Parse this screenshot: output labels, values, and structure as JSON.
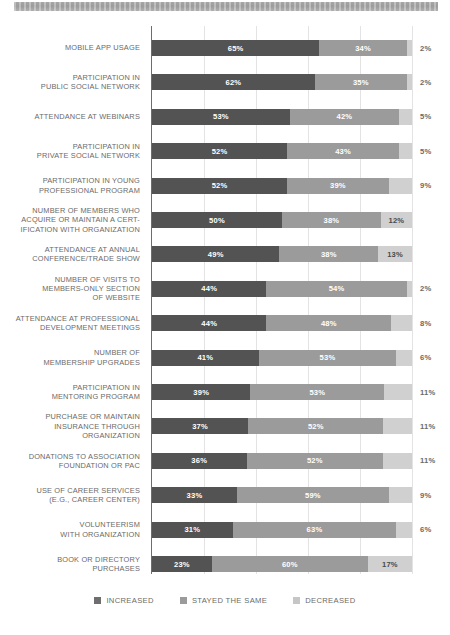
{
  "banner": {
    "name": "decorative-header-strip"
  },
  "chart_data": {
    "type": "bar",
    "subtype": "stacked-horizontal-100pct",
    "title": "",
    "xlabel": "",
    "ylabel": "",
    "xlim": [
      0,
      100
    ],
    "grid": true,
    "gridlines_pct": [
      0,
      20,
      40,
      60,
      80,
      100
    ],
    "legend_position": "bottom-center",
    "colors": {
      "increased": "#535353",
      "stayed_the_same": "#9b9b9b",
      "decreased": "#d0d0d0"
    },
    "categories": [
      "MOBILE APP USAGE",
      "PARTICIPATION IN\nPUBLIC SOCIAL NETWORK",
      "ATTENDANCE AT WEBINARS",
      "PARTICIPATION IN\nPRIVATE SOCIAL NETWORK",
      "PARTICIPATION IN YOUNG\nPROFESSIONAL PROGRAM",
      "NUMBER OF MEMBERS WHO\nACQUIRE OR MAINTAIN A CERT-\nIFICATION WITH ORGANIZATION",
      "ATTENDANCE AT ANNUAL\nCONFERENCE/TRADE SHOW",
      "NUMBER OF VISITS TO\nMEMBERS-ONLY SECTION\nOF WEBSITE",
      "ATTENDANCE AT PROFESSIONAL\nDEVELOPMENT MEETINGS",
      "NUMBER OF\nMEMBERSHIP UPGRADES",
      "PARTICIPATION IN\nMENTORING PROGRAM",
      "PURCHASE OR MAINTAIN\nINSURANCE THROUGH\nORGANIZATION",
      "DONATIONS TO ASSOCIATION\nFOUNDATION OR PAC",
      "USE OF CAREER SERVICES\n(E.G., CAREER CENTER)",
      "VOLUNTEERISM\nWITH ORGANIZATION",
      "BOOK OR DIRECTORY\nPURCHASES"
    ],
    "series": [
      {
        "name": "INCREASED",
        "color": "#535353",
        "values": [
          65,
          62,
          53,
          52,
          52,
          50,
          49,
          44,
          44,
          41,
          39,
          37,
          36,
          33,
          31,
          23
        ]
      },
      {
        "name": "STAYED THE SAME",
        "color": "#9b9b9b",
        "values": [
          34,
          35,
          42,
          43,
          39,
          38,
          38,
          54,
          48,
          53,
          53,
          52,
          52,
          59,
          63,
          60
        ]
      },
      {
        "name": "DECREASED",
        "color": "#d0d0d0",
        "values": [
          2,
          2,
          5,
          5,
          9,
          12,
          13,
          2,
          8,
          6,
          11,
          11,
          11,
          9,
          6,
          17
        ]
      }
    ],
    "value_labels": [
      {
        "increased": "65%",
        "stayed": "34%",
        "decreased": "2%",
        "decreased_outside": true
      },
      {
        "increased": "62%",
        "stayed": "35%",
        "decreased": "2%",
        "decreased_outside": true
      },
      {
        "increased": "53%",
        "stayed": "42%",
        "decreased": "5%",
        "decreased_outside": true
      },
      {
        "increased": "52%",
        "stayed": "43%",
        "decreased": "5%",
        "decreased_outside": true
      },
      {
        "increased": "52%",
        "stayed": "39%",
        "decreased": "9%",
        "decreased_outside": true
      },
      {
        "increased": "50%",
        "stayed": "38%",
        "decreased": "12%",
        "decreased_outside": false
      },
      {
        "increased": "49%",
        "stayed": "38%",
        "decreased": "13%",
        "decreased_outside": false
      },
      {
        "increased": "44%",
        "stayed": "54%",
        "decreased": "2%",
        "decreased_outside": true
      },
      {
        "increased": "44%",
        "stayed": "48%",
        "decreased": "8%",
        "decreased_outside": true
      },
      {
        "increased": "41%",
        "stayed": "53%",
        "decreased": "6%",
        "decreased_outside": true
      },
      {
        "increased": "39%",
        "stayed": "53%",
        "decreased": "11%",
        "decreased_outside": true
      },
      {
        "increased": "37%",
        "stayed": "52%",
        "decreased": "11%",
        "decreased_outside": true
      },
      {
        "increased": "36%",
        "stayed": "52%",
        "decreased": "11%",
        "decreased_outside": true
      },
      {
        "increased": "33%",
        "stayed": "59%",
        "decreased": "9%",
        "decreased_outside": true
      },
      {
        "increased": "31%",
        "stayed": "63%",
        "decreased": "6%",
        "decreased_outside": true
      },
      {
        "increased": "23%",
        "stayed": "60%",
        "decreased": "17%",
        "decreased_outside": false
      }
    ]
  },
  "legend": {
    "items": [
      {
        "label": "INCREASED",
        "color": "#6e6e6e"
      },
      {
        "label": "STAYED THE SAME",
        "color": "#9b9b9b"
      },
      {
        "label": "DECREASED",
        "color": "#c6c6c6"
      }
    ]
  }
}
